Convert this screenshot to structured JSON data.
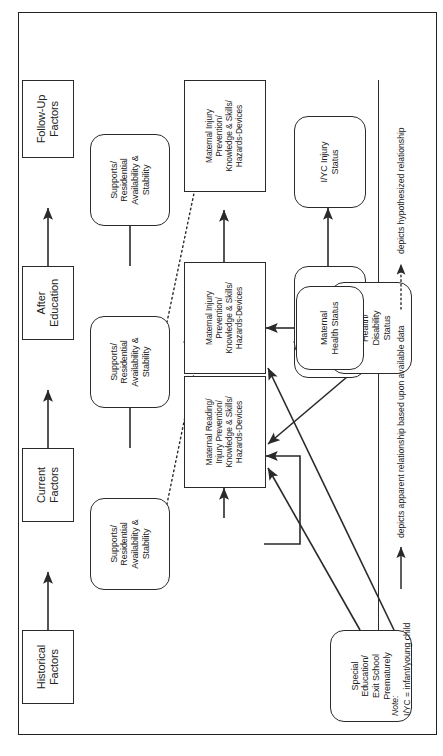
{
  "figure": {
    "type": "flow-diagram",
    "orientation": "rotated-90-ccw"
  },
  "columns": [
    {
      "id": "historical",
      "label_line1": "Historical",
      "label_line2": "Factors"
    },
    {
      "id": "current",
      "label_line1": "Current",
      "label_line2": "Factors"
    },
    {
      "id": "after",
      "label_line1": "After",
      "label_line2": "Education"
    },
    {
      "id": "followup",
      "label_line1": "Follow-Up",
      "label_line2": "Factors"
    }
  ],
  "nodes": {
    "special_education": {
      "shape": "rounded",
      "lines": [
        "Special",
        "Education/",
        "Exit School",
        "Prematurely"
      ]
    },
    "supports_current": {
      "shape": "rounded",
      "lines": [
        "Supports/",
        "Residential",
        "Availability &",
        "Stability"
      ]
    },
    "supports_after": {
      "shape": "rounded",
      "lines": [
        "Supports/",
        "Residential",
        "Availability &",
        "Stability"
      ]
    },
    "supports_followup": {
      "shape": "rounded",
      "lines": [
        "Supports/",
        "Residential",
        "Availability &",
        "Stability"
      ]
    },
    "maternal_reading_current": {
      "shape": "rectangle",
      "lines": [
        "Maternal Reading/",
        "Injury Prevention/",
        "Knowledge & Skills/",
        "Hazards-Devices"
      ]
    },
    "maternal_injury_after": {
      "shape": "rectangle",
      "lines": [
        "Maternal Injury",
        "Prevention/",
        "Knowledge & Skills/",
        "Hazards-Devices"
      ]
    },
    "maternal_injury_followup": {
      "shape": "rectangle",
      "lines": [
        "Maternal Injury",
        "Prevention/",
        "Knowledge & Skills/",
        "Hazards-Devices"
      ]
    },
    "maternal_health_disability": {
      "shape": "rounded",
      "lines": [
        "Maternal",
        "Health/",
        "Disability",
        "Status"
      ]
    },
    "maternal_health_status": {
      "shape": "rounded",
      "lines": [
        "Maternal",
        "Health Status"
      ]
    },
    "iyc_health_current": {
      "shape": "rounded",
      "lines": [
        "I/YC Health;",
        "Injury;",
        "Disability"
      ]
    },
    "iyc_injury_after": {
      "shape": "rounded",
      "lines": [
        "I/YC Injury",
        "Status"
      ]
    },
    "iyc_injury_followup": {
      "shape": "rounded",
      "lines": [
        "I/YC Injury",
        "Status"
      ]
    }
  },
  "legend": {
    "note_label": "Note:",
    "note_text": "I/YC = infant/young child",
    "solid_text": "depicts apparent relationship based upon available data",
    "dotted_text": "depicts hypothesized relationship"
  },
  "colors": {
    "stroke": "#2a2a2a",
    "background": "#ffffff",
    "text": "#1a1a1a"
  }
}
